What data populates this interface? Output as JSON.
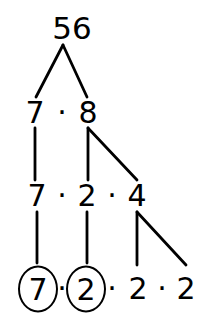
{
  "diagram": {
    "type": "factor-tree",
    "stroke_color": "#000000",
    "background_color": "#ffffff",
    "multiply_symbol": "·",
    "rows": [
      {
        "id": "row-root",
        "y": 28,
        "nodes": [
          {
            "id": "node-56",
            "label": "56",
            "x": 72,
            "circled": false
          }
        ],
        "separators": []
      },
      {
        "id": "row-2",
        "y": 113,
        "nodes": [
          {
            "id": "node-7-a",
            "label": "7",
            "x": 35,
            "circled": false
          },
          {
            "id": "node-8",
            "label": "8",
            "x": 88,
            "circled": false
          }
        ],
        "separators": [
          {
            "id": "dot-r2-1",
            "x": 62,
            "label": "·"
          }
        ]
      },
      {
        "id": "row-3",
        "y": 196,
        "nodes": [
          {
            "id": "node-7-b",
            "label": "7",
            "x": 37,
            "circled": false
          },
          {
            "id": "node-2-a",
            "label": "2",
            "x": 87,
            "circled": false
          },
          {
            "id": "node-4",
            "label": "4",
            "x": 137,
            "circled": false
          }
        ],
        "separators": [
          {
            "id": "dot-r3-1",
            "x": 62,
            "label": "·"
          },
          {
            "id": "dot-r3-2",
            "x": 112,
            "label": "·"
          }
        ]
      },
      {
        "id": "row-leaves",
        "y": 289,
        "nodes": [
          {
            "id": "leaf-7",
            "label": "7",
            "x": 38,
            "circled": true
          },
          {
            "id": "leaf-2-a",
            "label": "2",
            "x": 86,
            "circled": true
          },
          {
            "id": "leaf-2-b",
            "label": "2",
            "x": 138,
            "circled": false
          },
          {
            "id": "leaf-2-c",
            "label": "2",
            "x": 186,
            "circled": false
          }
        ],
        "separators": [
          {
            "id": "dot-r4-1",
            "x": 62,
            "label": "·"
          },
          {
            "id": "dot-r4-2",
            "x": 112,
            "label": "·"
          },
          {
            "id": "dot-r4-3",
            "x": 162,
            "label": "·"
          }
        ]
      }
    ],
    "branches": [
      {
        "id": "branch-56-to-7",
        "from": "node-56",
        "to": "node-7-a",
        "x1": 63,
        "y1": 45,
        "x2": 36,
        "y2": 97
      },
      {
        "id": "branch-56-to-8",
        "from": "node-56",
        "to": "node-8",
        "x1": 63,
        "y1": 45,
        "x2": 87,
        "y2": 97
      },
      {
        "id": "branch-7-to-7",
        "from": "node-7-a",
        "to": "node-7-b",
        "x1": 35,
        "y1": 128,
        "x2": 35,
        "y2": 180
      },
      {
        "id": "branch-8-to-2",
        "from": "node-8",
        "to": "node-2-a",
        "x1": 88,
        "y1": 128,
        "x2": 88,
        "y2": 180
      },
      {
        "id": "branch-8-to-4",
        "from": "node-8",
        "to": "node-4",
        "x1": 88,
        "y1": 128,
        "x2": 137,
        "y2": 180
      },
      {
        "id": "branch-7b-to-leaf7",
        "from": "node-7-b",
        "to": "leaf-7",
        "x1": 37,
        "y1": 212,
        "x2": 37,
        "y2": 263
      },
      {
        "id": "branch-2a-to-leaf2",
        "from": "node-2-a",
        "to": "leaf-2-a",
        "x1": 87,
        "y1": 212,
        "x2": 87,
        "y2": 263
      },
      {
        "id": "branch-4-to-leaf2b",
        "from": "node-4",
        "to": "leaf-2-b",
        "x1": 137,
        "y1": 212,
        "x2": 137,
        "y2": 265
      },
      {
        "id": "branch-4-to-leaf2c",
        "from": "node-4",
        "to": "leaf-2-c",
        "x1": 137,
        "y1": 212,
        "x2": 186,
        "y2": 265
      }
    ]
  }
}
